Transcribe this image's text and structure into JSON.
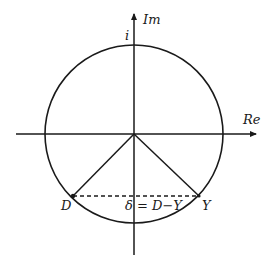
{
  "diagram": {
    "type": "complex-plane-unit-circle",
    "axes": {
      "real_label": "Re",
      "imag_label": "Im",
      "imag_unit_label": "i"
    },
    "points": [
      {
        "name": "D",
        "label": "D"
      },
      {
        "name": "Y",
        "label": "Y"
      }
    ],
    "chord_label": "δ = D−Y",
    "colors": {
      "stroke": "#1a1a1a",
      "background": "#ffffff"
    }
  }
}
